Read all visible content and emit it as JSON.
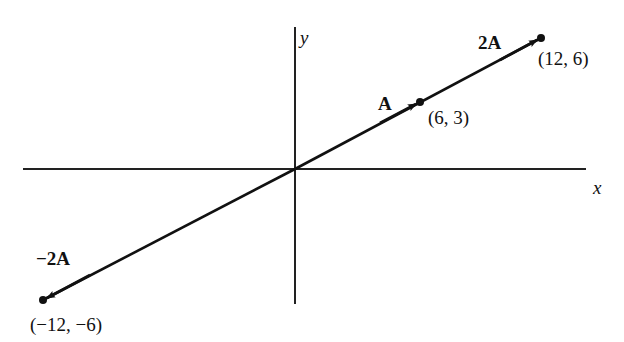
{
  "axes": {
    "x_label": "x",
    "y_label": "y",
    "origin_px": [
      295,
      169
    ],
    "x_axis_px": [
      23,
      586
    ],
    "y_axis_px": [
      27,
      304
    ]
  },
  "vectors": [
    {
      "name": "A",
      "label": "A",
      "tip": "(6, 3)",
      "tip_px": [
        420,
        102
      ]
    },
    {
      "name": "2A",
      "label": "2A",
      "tip": "(12, 6)",
      "tip_px": [
        541,
        38
      ]
    },
    {
      "name": "-2A",
      "label": "−2A",
      "tip": "(−12, −6)",
      "tip_px": [
        43,
        300
      ]
    }
  ],
  "colors": {
    "ink": "#111111",
    "background": "#ffffff"
  }
}
